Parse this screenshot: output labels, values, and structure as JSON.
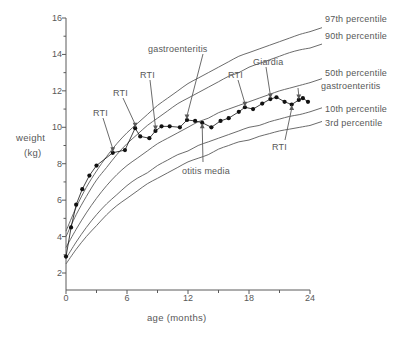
{
  "figure": {
    "background": "#ffffff",
    "line_color": "#5a5a5a",
    "point_color": "#111111"
  },
  "axes": {
    "x_title": "age  (months)",
    "y_title_line1": "weight",
    "y_title_line2": "(kg)",
    "x_ticks": [
      "0",
      "6",
      "12",
      "18",
      "24"
    ],
    "y_ticks": [
      "2",
      "4",
      "6",
      "8",
      "10",
      "12",
      "14",
      "16"
    ]
  },
  "chart_data": {
    "type": "line",
    "title": "",
    "xlabel": "age  (months)",
    "ylabel": "weight (kg)",
    "xlim": [
      0,
      24
    ],
    "ylim": [
      2,
      16
    ],
    "xticks": [
      0,
      6,
      12,
      18,
      24
    ],
    "xminorticks": [
      3,
      9,
      15,
      21
    ],
    "yticks": [
      2,
      4,
      6,
      8,
      10,
      12,
      14,
      16
    ],
    "grid": false,
    "legend_position": "right-outside",
    "series": [
      {
        "name": "97th percentile",
        "kind": "reference-curve",
        "x": [
          0,
          1,
          2,
          3,
          4,
          5,
          6,
          7,
          8,
          9,
          10,
          11,
          12,
          13,
          14,
          15,
          16,
          17,
          18,
          19,
          20,
          21,
          22,
          23,
          24
        ],
        "values": [
          4.3,
          5.6,
          6.7,
          7.6,
          8.4,
          9.1,
          9.7,
          10.2,
          10.7,
          11.2,
          11.6,
          12.0,
          12.4,
          12.7,
          13.0,
          13.3,
          13.6,
          13.9,
          14.1,
          14.3,
          14.5,
          14.7,
          14.9,
          15.1,
          15.25
        ]
      },
      {
        "name": "90th percentile",
        "kind": "reference-curve",
        "x": [
          0,
          1,
          2,
          3,
          4,
          5,
          6,
          7,
          8,
          9,
          10,
          11,
          12,
          13,
          14,
          15,
          16,
          17,
          18,
          19,
          20,
          21,
          22,
          23,
          24
        ],
        "values": [
          4.0,
          5.2,
          6.2,
          7.1,
          7.8,
          8.5,
          9.1,
          9.6,
          10.1,
          10.5,
          10.9,
          11.3,
          11.6,
          11.9,
          12.2,
          12.5,
          12.8,
          13.0,
          13.3,
          13.5,
          13.7,
          13.9,
          14.1,
          14.25,
          14.35
        ]
      },
      {
        "name": "50th percentile",
        "kind": "reference-curve",
        "x": [
          0,
          1,
          2,
          3,
          4,
          5,
          6,
          7,
          8,
          9,
          10,
          11,
          12,
          13,
          14,
          15,
          16,
          17,
          18,
          19,
          20,
          21,
          22,
          23,
          24
        ],
        "values": [
          3.4,
          4.4,
          5.3,
          6.1,
          6.8,
          7.4,
          7.9,
          8.3,
          8.7,
          9.1,
          9.4,
          9.7,
          10.0,
          10.3,
          10.5,
          10.8,
          11.0,
          11.2,
          11.4,
          11.6,
          11.8,
          12.0,
          12.15,
          12.3,
          12.45
        ]
      },
      {
        "name": "10th percentile",
        "kind": "reference-curve",
        "x": [
          0,
          1,
          2,
          3,
          4,
          5,
          6,
          7,
          8,
          9,
          10,
          11,
          12,
          13,
          14,
          15,
          16,
          17,
          18,
          19,
          20,
          21,
          22,
          23,
          24
        ],
        "values": [
          2.8,
          3.7,
          4.5,
          5.2,
          5.8,
          6.3,
          6.8,
          7.2,
          7.5,
          7.9,
          8.2,
          8.5,
          8.7,
          9.0,
          9.2,
          9.4,
          9.6,
          9.8,
          10.0,
          10.1,
          10.3,
          10.45,
          10.6,
          10.7,
          10.85
        ]
      },
      {
        "name": "3rd percentile",
        "kind": "reference-curve",
        "x": [
          0,
          1,
          2,
          3,
          4,
          5,
          6,
          7,
          8,
          9,
          10,
          11,
          12,
          13,
          14,
          15,
          16,
          17,
          18,
          19,
          20,
          21,
          22,
          23,
          24
        ],
        "values": [
          2.5,
          3.3,
          4.0,
          4.6,
          5.2,
          5.7,
          6.1,
          6.5,
          6.9,
          7.2,
          7.5,
          7.8,
          8.1,
          8.3,
          8.5,
          8.8,
          9.0,
          9.2,
          9.3,
          9.5,
          9.65,
          9.8,
          9.9,
          10.0,
          10.1
        ]
      },
      {
        "name": "child weight",
        "kind": "measured",
        "marker": "filled-circle",
        "points": [
          {
            "x": 0.0,
            "y": 2.9
          },
          {
            "x": 0.5,
            "y": 4.5
          },
          {
            "x": 1.0,
            "y": 5.75
          },
          {
            "x": 1.6,
            "y": 6.6
          },
          {
            "x": 2.3,
            "y": 7.35
          },
          {
            "x": 3.0,
            "y": 7.9
          },
          {
            "x": 4.6,
            "y": 8.6
          },
          {
            "x": 5.8,
            "y": 8.75
          },
          {
            "x": 6.8,
            "y": 9.95
          },
          {
            "x": 7.3,
            "y": 9.5
          },
          {
            "x": 8.2,
            "y": 9.4
          },
          {
            "x": 8.8,
            "y": 9.8
          },
          {
            "x": 9.4,
            "y": 10.05
          },
          {
            "x": 10.2,
            "y": 10.05
          },
          {
            "x": 11.2,
            "y": 10.0
          },
          {
            "x": 11.9,
            "y": 10.4
          },
          {
            "x": 12.7,
            "y": 10.35
          },
          {
            "x": 13.4,
            "y": 10.25
          },
          {
            "x": 14.3,
            "y": 10.0
          },
          {
            "x": 15.2,
            "y": 10.35
          },
          {
            "x": 16.0,
            "y": 10.5
          },
          {
            "x": 17.0,
            "y": 10.85
          },
          {
            "x": 17.6,
            "y": 11.1
          },
          {
            "x": 18.4,
            "y": 11.0
          },
          {
            "x": 19.3,
            "y": 11.3
          },
          {
            "x": 20.1,
            "y": 11.55
          },
          {
            "x": 20.7,
            "y": 11.65
          },
          {
            "x": 21.5,
            "y": 11.4
          },
          {
            "x": 22.2,
            "y": 11.25
          },
          {
            "x": 22.9,
            "y": 11.5
          },
          {
            "x": 23.3,
            "y": 11.6
          },
          {
            "x": 23.8,
            "y": 11.4
          }
        ]
      }
    ],
    "annotations": [
      {
        "label": "RTI",
        "x": 4.6,
        "y": 8.6,
        "arrow": "down"
      },
      {
        "label": "RTI",
        "x": 6.8,
        "y": 9.95,
        "arrow": "down"
      },
      {
        "label": "RTI",
        "x": 8.8,
        "y": 9.8,
        "arrow": "down"
      },
      {
        "label": "gastroenteritis",
        "x": 11.9,
        "y": 10.4,
        "arrow": "down"
      },
      {
        "label": "otitis media",
        "x": 13.4,
        "y": 10.25,
        "arrow": "up"
      },
      {
        "label": "RTI",
        "x": 17.6,
        "y": 11.1,
        "arrow": "down"
      },
      {
        "label": "Giardia",
        "x": 20.1,
        "y": 11.55,
        "arrow": "down"
      },
      {
        "label": "gastroenteritis",
        "x": 22.9,
        "y": 11.5,
        "arrow": "down"
      },
      {
        "label": "RTI",
        "x": 22.2,
        "y": 11.25,
        "arrow": "up"
      }
    ]
  },
  "side_labels": [
    {
      "text": "97th percentile"
    },
    {
      "text": "90th percentile"
    },
    {
      "text": "50th percentile"
    },
    {
      "text": "gastroenteritis"
    },
    {
      "text": "10th percentile"
    },
    {
      "text": "3rd percentile"
    }
  ],
  "annotation_labels": {
    "rti_1": "RTI",
    "rti_2": "RTI",
    "rti_3": "RTI",
    "gastroenteritis_1": "gastroenteritis",
    "otitis_media": "otitis media",
    "rti_4": "RTI",
    "giardia": "Giardia",
    "rti_5": "RTI"
  }
}
